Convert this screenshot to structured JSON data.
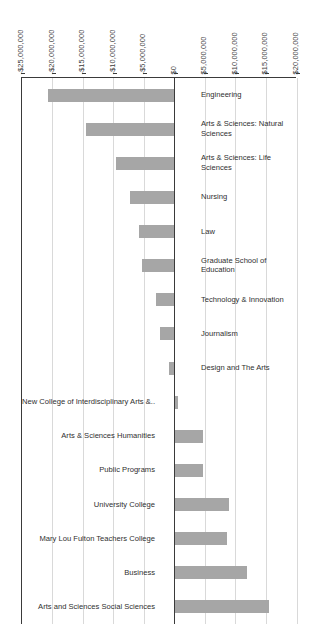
{
  "chart_data": {
    "type": "bar",
    "orientation": "horizontal",
    "title": "",
    "subtitle": "",
    "xlabel": "",
    "ylabel": "",
    "xlim": [
      -25000000,
      20000000
    ],
    "grid": true,
    "legend": "none",
    "axis_tick_labels": [
      "-$25,000,000",
      "-$20,000,000",
      "-$15,000,000",
      "-$10,000,000",
      "-$5,000,000",
      "$0",
      "$5,000,000",
      "$10,000,000",
      "$15,000,000",
      "$20,000,000"
    ],
    "axis_tick_values": [
      -25000000,
      -20000000,
      -15000000,
      -10000000,
      -5000000,
      0,
      5000000,
      10000000,
      15000000,
      20000000
    ],
    "categories": [
      "Engineering",
      "Arts & Sciences: Natural Sciences",
      "Arts & Sciences: Life Sciences",
      "Nursing",
      "Law",
      "Graduate School of Education",
      "Technology & Innovation",
      "Journalism",
      "Design and The Arts",
      "New College of Interdisciplinary Arts &..",
      "Arts & Sciences Humanities",
      "Public Programs",
      "University College",
      "Mary Lou Fulton Teachers College",
      "Business",
      "Arts and Sciences Social Sciences"
    ],
    "values": [
      -20700000,
      -14600000,
      -9600000,
      -7400000,
      -5800000,
      -5300000,
      -3100000,
      -2400000,
      -900000,
      500000,
      4700000,
      4700000,
      8900000,
      8600000,
      11900000,
      15500000
    ],
    "bar_color": "#a6a6a6",
    "axis_color": "#3a3a3a",
    "gridline_color": "#d9d9d9",
    "background_color": "#ffffff"
  }
}
